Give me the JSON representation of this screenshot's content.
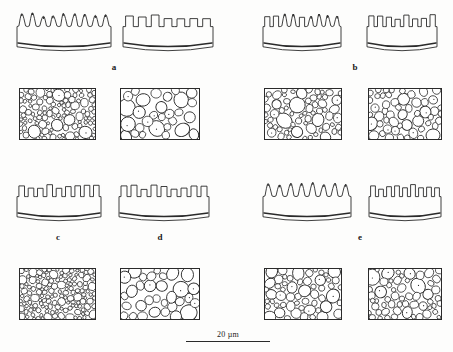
{
  "figure": {
    "background_color": "#fdfdfc",
    "ink_color": "#2a2a2a",
    "width": 453,
    "height": 352
  },
  "scale_bar": {
    "label": "20 µm",
    "length_px": 84
  },
  "group_labels": [
    {
      "id": "a",
      "text": "a",
      "x": 104,
      "y": 62
    },
    {
      "id": "b",
      "text": "b",
      "x": 345,
      "y": 62
    },
    {
      "id": "c",
      "text": "c",
      "x": 48,
      "y": 232
    },
    {
      "id": "d",
      "text": "d",
      "x": 150,
      "y": 232
    },
    {
      "id": "e",
      "text": "e",
      "x": 350,
      "y": 232
    }
  ],
  "profiles": [
    {
      "id": "profile-a-left",
      "group": "a",
      "crest_style": "spiked",
      "x": 16,
      "y": 10,
      "w": 96,
      "h": 46,
      "teeth": 9,
      "seed": 11
    },
    {
      "id": "profile-a-right",
      "group": "a",
      "crest_style": "castellated",
      "x": 122,
      "y": 10,
      "w": 92,
      "h": 46,
      "teeth": 7,
      "seed": 22
    },
    {
      "id": "profile-b-left",
      "group": "b",
      "crest_style": "mixed",
      "x": 262,
      "y": 10,
      "w": 80,
      "h": 46,
      "teeth": 9,
      "seed": 33
    },
    {
      "id": "profile-b-right",
      "group": "b",
      "crest_style": "castellated",
      "x": 366,
      "y": 10,
      "w": 72,
      "h": 46,
      "teeth": 8,
      "seed": 44
    },
    {
      "id": "profile-c-left",
      "group": "c",
      "crest_style": "castellated",
      "x": 16,
      "y": 180,
      "w": 86,
      "h": 46,
      "teeth": 9,
      "seed": 55
    },
    {
      "id": "profile-d-right",
      "group": "d",
      "crest_style": "castellated",
      "x": 118,
      "y": 180,
      "w": 92,
      "h": 46,
      "teeth": 9,
      "seed": 66
    },
    {
      "id": "profile-e-left",
      "group": "e",
      "crest_style": "spiked",
      "x": 262,
      "y": 180,
      "w": 90,
      "h": 46,
      "teeth": 8,
      "seed": 77
    },
    {
      "id": "profile-e-right",
      "group": "e",
      "crest_style": "castellated",
      "x": 368,
      "y": 180,
      "w": 74,
      "h": 46,
      "teeth": 9,
      "seed": 88
    }
  ],
  "pore_panels": [
    {
      "id": "pores-a-left",
      "group": "a",
      "x": 19,
      "y": 88,
      "w": 77,
      "h": 52,
      "density": "fine-mixed",
      "count": 120,
      "min_r": 1.6,
      "max_r": 7.0,
      "seed": 101
    },
    {
      "id": "pores-a-right",
      "group": "a",
      "x": 120,
      "y": 88,
      "w": 80,
      "h": 52,
      "density": "coarse",
      "count": 48,
      "min_r": 3.4,
      "max_r": 8.6,
      "seed": 202
    },
    {
      "id": "pores-b-left",
      "group": "b",
      "x": 264,
      "y": 88,
      "w": 78,
      "h": 52,
      "density": "medium-mixed",
      "count": 78,
      "min_r": 2.0,
      "max_r": 7.8,
      "seed": 303
    },
    {
      "id": "pores-b-right",
      "group": "b",
      "x": 368,
      "y": 88,
      "w": 74,
      "h": 52,
      "density": "medium",
      "count": 72,
      "min_r": 2.6,
      "max_r": 6.6,
      "seed": 404
    },
    {
      "id": "pores-c-left",
      "group": "c",
      "x": 19,
      "y": 268,
      "w": 77,
      "h": 52,
      "density": "fine",
      "count": 140,
      "min_r": 1.5,
      "max_r": 4.4,
      "seed": 505
    },
    {
      "id": "pores-d-right",
      "group": "d",
      "x": 120,
      "y": 268,
      "w": 80,
      "h": 52,
      "density": "coarse-sparse",
      "count": 40,
      "min_r": 3.6,
      "max_r": 8.2,
      "seed": 606
    },
    {
      "id": "pores-e-left",
      "group": "e",
      "x": 264,
      "y": 268,
      "w": 78,
      "h": 52,
      "density": "medium-mixed",
      "count": 70,
      "min_r": 2.2,
      "max_r": 7.4,
      "seed": 707
    },
    {
      "id": "pores-e-right",
      "group": "e",
      "x": 368,
      "y": 268,
      "w": 74,
      "h": 52,
      "density": "mixed",
      "count": 66,
      "min_r": 2.0,
      "max_r": 8.0,
      "seed": 808
    }
  ]
}
